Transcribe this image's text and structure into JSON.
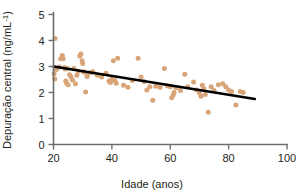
{
  "figure": {
    "background_color": "#ffffff",
    "point_color": "#d9a578",
    "line_color": "#000000",
    "axis_color": "#6d6e71"
  },
  "axes": {
    "x_title": "Idade (anos)",
    "y_title_main": "Depuração central (ng/mL",
    "y_title_sup": "-1",
    "y_title_close": ")",
    "y_title_full": "Depuração central (ng/mL-1)",
    "x_ticks": [
      "20",
      "40",
      "60",
      "80",
      "100"
    ],
    "y_ticks": [
      "0",
      "1",
      "2",
      "3",
      "4",
      "5"
    ]
  },
  "chart_data": {
    "type": "scatter",
    "title": "",
    "xlabel": "Idade (anos)",
    "ylabel": "Depuração central (ng/mL-1)",
    "xlim": [
      14,
      104
    ],
    "ylim": [
      0,
      5
    ],
    "xticks": [
      20,
      40,
      60,
      80,
      100
    ],
    "yticks": [
      0,
      1,
      2,
      3,
      4,
      5
    ],
    "grid": false,
    "legend": "none",
    "marker_color": "#d9a578",
    "marker_size": 5,
    "series": [
      {
        "name": "Depuração central vs Idade",
        "points": [
          [
            20.5,
            4.08
          ],
          [
            20.2,
            2.72
          ],
          [
            20.4,
            2.52
          ],
          [
            21.0,
            2.88
          ],
          [
            22.0,
            2.98
          ],
          [
            22.5,
            3.3
          ],
          [
            23.0,
            3.42
          ],
          [
            23.3,
            3.3
          ],
          [
            23.8,
            2.96
          ],
          [
            24.0,
            2.9
          ],
          [
            24.2,
            2.44
          ],
          [
            24.5,
            2.36
          ],
          [
            24.8,
            2.92
          ],
          [
            25.0,
            2.3
          ],
          [
            25.5,
            2.68
          ],
          [
            26.0,
            2.6
          ],
          [
            26.5,
            2.48
          ],
          [
            27.0,
            2.92
          ],
          [
            27.5,
            2.34
          ],
          [
            28.0,
            2.66
          ],
          [
            28.5,
            2.82
          ],
          [
            29.0,
            3.4
          ],
          [
            29.4,
            3.48
          ],
          [
            29.8,
            3.22
          ],
          [
            30.0,
            3.12
          ],
          [
            30.3,
            2.8
          ],
          [
            30.6,
            2.78
          ],
          [
            31.0,
            2.02
          ],
          [
            31.5,
            2.62
          ],
          [
            32.0,
            2.74
          ],
          [
            33.0,
            2.78
          ],
          [
            33.5,
            2.8
          ],
          [
            35.0,
            2.66
          ],
          [
            36.5,
            2.6
          ],
          [
            38.0,
            2.74
          ],
          [
            39.0,
            2.44
          ],
          [
            39.5,
            2.38
          ],
          [
            40.0,
            2.52
          ],
          [
            40.5,
            3.22
          ],
          [
            41.0,
            2.46
          ],
          [
            41.5,
            2.36
          ],
          [
            42.0,
            3.32
          ],
          [
            44.0,
            2.28
          ],
          [
            45.5,
            2.2
          ],
          [
            47.0,
            2.46
          ],
          [
            49.0,
            3.32
          ],
          [
            50.0,
            2.6
          ],
          [
            51.0,
            2.42
          ],
          [
            52.0,
            2.1
          ],
          [
            53.0,
            2.22
          ],
          [
            54.0,
            1.7
          ],
          [
            55.0,
            2.24
          ],
          [
            56.5,
            2.2
          ],
          [
            58.0,
            2.92
          ],
          [
            59.0,
            2.26
          ],
          [
            60.0,
            2.22
          ],
          [
            60.5,
            1.8
          ],
          [
            61.0,
            1.9
          ],
          [
            61.3,
            2.0
          ],
          [
            62.0,
            2.18
          ],
          [
            63.5,
            2.08
          ],
          [
            65.0,
            2.7
          ],
          [
            66.0,
            2.22
          ],
          [
            68.0,
            2.4
          ],
          [
            69.0,
            2.1
          ],
          [
            70.0,
            1.98
          ],
          [
            70.5,
            1.86
          ],
          [
            71.0,
            2.28
          ],
          [
            71.5,
            2.14
          ],
          [
            72.0,
            1.92
          ],
          [
            73.0,
            1.24
          ],
          [
            74.0,
            2.22
          ],
          [
            75.0,
            2.08
          ],
          [
            76.5,
            2.3
          ],
          [
            78.0,
            2.34
          ],
          [
            79.0,
            2.22
          ],
          [
            80.0,
            2.1
          ],
          [
            81.0,
            2.04
          ],
          [
            82.5,
            1.52
          ],
          [
            84.0,
            2.04
          ],
          [
            85.0,
            2.0
          ]
        ]
      }
    ],
    "trend_line": {
      "type": "linear-regression",
      "x_start": 20,
      "y_start": 3.0,
      "x_end": 89,
      "y_end": 1.75
    }
  }
}
